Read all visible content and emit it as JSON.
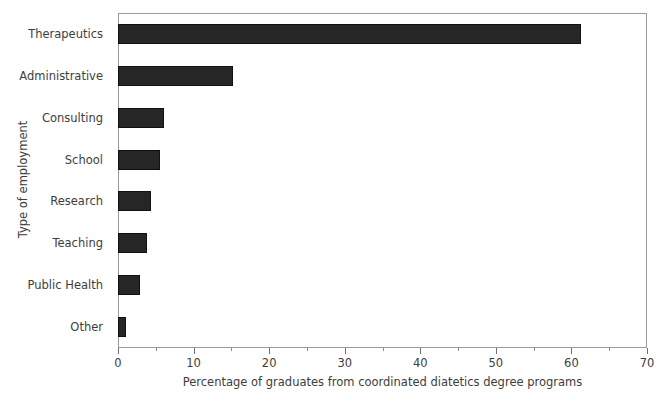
{
  "chart_data": {
    "type": "bar",
    "orientation": "horizontal",
    "title": "",
    "xlabel": "Percentage of graduates from coordinated diatetics degree programs",
    "ylabel": "Type of employment",
    "categories": [
      "Therapeutics",
      "Administrative",
      "Consulting",
      "School",
      "Research",
      "Teaching",
      "Public Health",
      "Other"
    ],
    "values": [
      61.3,
      15.2,
      6.1,
      5.5,
      4.4,
      3.8,
      2.9,
      1.1
    ],
    "xlim": [
      0,
      70
    ],
    "xticks": [
      0,
      10,
      20,
      30,
      40,
      50,
      60,
      70
    ],
    "xtick_labels": [
      "0",
      "10",
      "20",
      "30",
      "40",
      "50",
      "60",
      "70"
    ],
    "xminor_ticks": [
      5,
      15,
      25,
      35,
      45,
      55,
      65
    ],
    "grid": false,
    "legend": false,
    "bar_color": "#262626",
    "bar_edge_color": "#111111",
    "frame_color": "#9a9a9a",
    "text_color": "#3d3d3d",
    "background": "#ffffff"
  }
}
